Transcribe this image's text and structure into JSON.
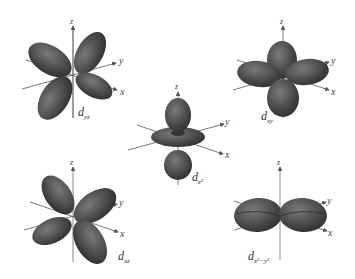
{
  "figure": {
    "lobe_color": "#4a4a4a",
    "lobe_highlight": "#6e6e6e",
    "axis_color": "#555555",
    "orbitals": [
      {
        "id": "dyz",
        "label_main": "d",
        "label_sub": "yz",
        "axes": {
          "x": "x",
          "y": "y",
          "z": "z"
        }
      },
      {
        "id": "dxy",
        "label_main": "d",
        "label_sub": "xy",
        "axes": {
          "x": "x",
          "y": "y",
          "z": "z"
        }
      },
      {
        "id": "dz2",
        "label_main": "d",
        "label_sub": "z²",
        "axes": {
          "x": "x",
          "y": "y",
          "z": "z"
        }
      },
      {
        "id": "dxz",
        "label_main": "d",
        "label_sub": "xz",
        "axes": {
          "x": "x",
          "y": "y",
          "z": "z"
        }
      },
      {
        "id": "dx2y2",
        "label_main": "d",
        "label_sub": "x²−y²",
        "axes": {
          "x": "x",
          "y": "y",
          "z": "z"
        }
      }
    ]
  }
}
